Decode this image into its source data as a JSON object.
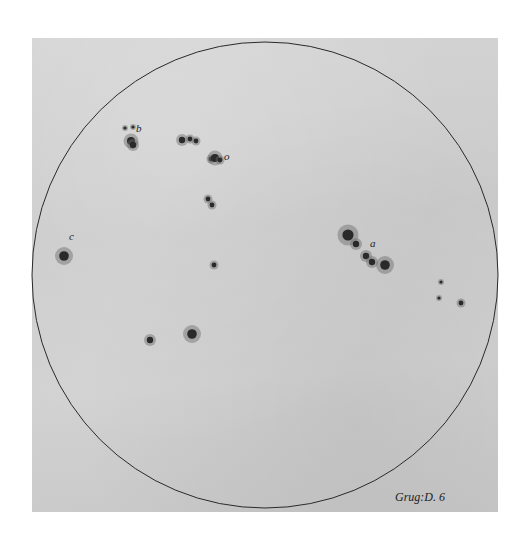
{
  "figure": {
    "plate_caption": "Grug:D. 6",
    "colors": {
      "paper": "#cfcfcf",
      "ink": "#222222",
      "spot": "#2a2a2a",
      "penumbra": "#6a6a6a"
    },
    "disk": {
      "cx": 265,
      "cy": 275,
      "r": 233
    },
    "labels": [
      {
        "text": "b",
        "x": 136,
        "y": 132
      },
      {
        "text": "o",
        "x": 224,
        "y": 160
      },
      {
        "text": "c",
        "x": 69,
        "y": 240
      },
      {
        "text": "a",
        "x": 370,
        "y": 247
      }
    ],
    "spot_groups": [
      {
        "name": "group-b",
        "spots": [
          [
            125,
            128,
            2
          ],
          [
            133,
            127,
            2
          ],
          [
            131,
            141,
            5
          ],
          [
            133,
            145,
            4
          ]
        ]
      },
      {
        "name": "group-top-center",
        "spots": [
          [
            182,
            140,
            4
          ],
          [
            190,
            139,
            3
          ],
          [
            196,
            141,
            3
          ]
        ]
      },
      {
        "name": "group-o",
        "spots": [
          [
            211,
            159,
            3
          ],
          [
            215,
            158,
            5
          ],
          [
            220,
            160,
            3
          ]
        ]
      },
      {
        "name": "group-center-small",
        "spots": [
          [
            208,
            199,
            3
          ],
          [
            212,
            205,
            3
          ]
        ]
      },
      {
        "name": "group-a",
        "spots": [
          [
            348,
            235,
            7
          ],
          [
            356,
            244,
            4
          ],
          [
            366,
            256,
            4
          ],
          [
            372,
            262,
            4
          ],
          [
            385,
            265,
            6
          ]
        ]
      },
      {
        "name": "group-c",
        "spots": [
          [
            64,
            256,
            6
          ]
        ]
      },
      {
        "name": "group-lower-left",
        "spots": [
          [
            150,
            340,
            4
          ]
        ]
      },
      {
        "name": "group-lower-mid",
        "spots": [
          [
            192,
            334,
            6
          ]
        ]
      },
      {
        "name": "group-center-faint",
        "spots": [
          [
            214,
            265,
            3
          ]
        ]
      },
      {
        "name": "group-right",
        "spots": [
          [
            441,
            282,
            2
          ],
          [
            439,
            298,
            2
          ],
          [
            461,
            303,
            3
          ]
        ]
      }
    ]
  }
}
